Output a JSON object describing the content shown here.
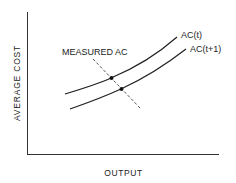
{
  "diagram": {
    "y_axis_label": "AVERAGE COST",
    "x_axis_label": "OUTPUT",
    "curves": [
      {
        "name": "AC(t)",
        "label": "AC(t)"
      },
      {
        "name": "AC(t+1)",
        "label": "AC(t+1)"
      }
    ],
    "measured_line_label": "MEASURED AC",
    "colors": {
      "ink": "#222222",
      "dashed": "#444444",
      "background": "#ffffff"
    }
  }
}
